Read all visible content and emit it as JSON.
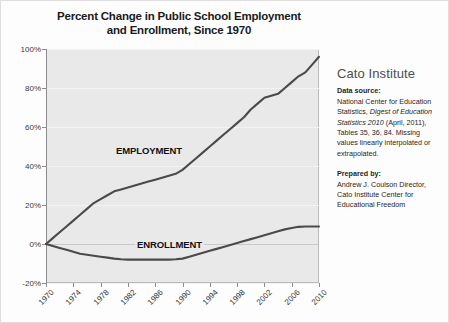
{
  "title": {
    "line1": "Percent Change in Public School Employment",
    "line2": "and Enrollment, Since 1970"
  },
  "side_panel": {
    "brand": "Cato Institute",
    "source_heading": "Data source:",
    "source_text_1": "National Center for Education Statistics, ",
    "source_text_italic": "Digest of Education Statistics 2010",
    "source_text_2": " (April, 2011), Tables 35, 36, 84.  Missing values linearly interpolated or extrapolated.",
    "prepared_heading": "Prepared by:",
    "prepared_text": "Andrew J. Coulson Director, Cato Institute Center for Educational Freedom"
  },
  "chart_data": {
    "type": "line",
    "title": "Percent Change in Public School Employment and Enrollment, Since 1970",
    "xlabel": "",
    "ylabel": "",
    "xlim": [
      1970,
      2010
    ],
    "ylim": [
      -20,
      100
    ],
    "grid": true,
    "legend": "inline-labels",
    "y_ticks": [
      100,
      80,
      60,
      40,
      20,
      0,
      -20
    ],
    "y_tick_labels": [
      "100%",
      "80%",
      "60%",
      "40%",
      "20%",
      "0%",
      "-20%"
    ],
    "x_ticks": [
      1970,
      1974,
      1978,
      1982,
      1986,
      1990,
      1994,
      1998,
      2002,
      2006,
      2010
    ],
    "x_tick_labels": [
      "1970",
      "1974",
      "1978",
      "1982",
      "1986",
      "1990",
      "1994",
      "1998",
      "2002",
      "2006",
      "2010"
    ],
    "x": [
      1970,
      1971,
      1972,
      1973,
      1974,
      1975,
      1976,
      1977,
      1978,
      1979,
      1980,
      1981,
      1982,
      1983,
      1984,
      1985,
      1986,
      1987,
      1988,
      1989,
      1990,
      1991,
      1992,
      1993,
      1994,
      1995,
      1996,
      1997,
      1998,
      1999,
      2000,
      2001,
      2002,
      2003,
      2004,
      2005,
      2006,
      2007,
      2008,
      2009,
      2010
    ],
    "series": [
      {
        "name": "EMPLOYMENT",
        "color": "#4a4a4a",
        "values": [
          0,
          3,
          6,
          9,
          12,
          15,
          18,
          21,
          23,
          25,
          27,
          28,
          29,
          30,
          31,
          32,
          33,
          34,
          35,
          36,
          38,
          41,
          44,
          47,
          50,
          53,
          56,
          59,
          62,
          65,
          69,
          72,
          75,
          76,
          77,
          80,
          83,
          86,
          88,
          92,
          96
        ]
      },
      {
        "name": "ENROLLMENT",
        "color": "#4a4a4a",
        "values": [
          0,
          -1,
          -2,
          -3,
          -4,
          -5,
          -5.5,
          -6,
          -6.5,
          -7,
          -7.5,
          -7.8,
          -8,
          -8,
          -8,
          -8,
          -8,
          -8,
          -8,
          -7.8,
          -7.5,
          -6.5,
          -5.5,
          -4.5,
          -3.5,
          -2.5,
          -1.5,
          -0.5,
          0.5,
          1.5,
          2.5,
          3.5,
          4.5,
          5.5,
          6.5,
          7.5,
          8.2,
          8.8,
          9,
          9,
          9
        ]
      }
    ]
  }
}
